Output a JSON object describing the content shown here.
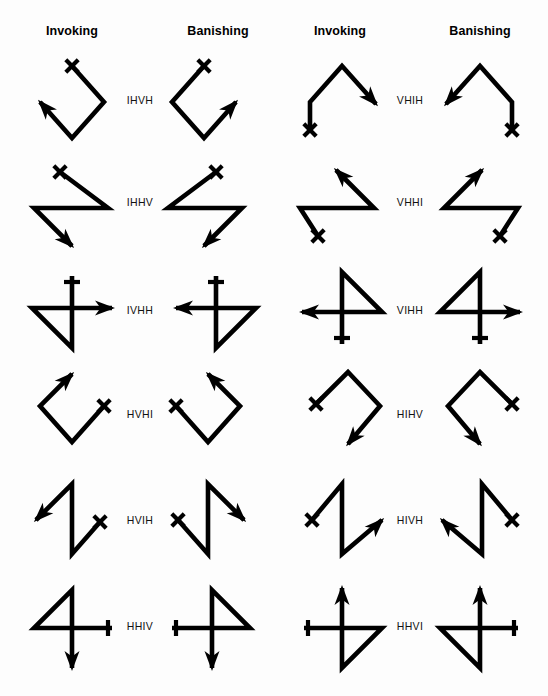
{
  "page": {
    "background": "#ffffff",
    "ink": "#000000",
    "width": 548,
    "height": 696
  },
  "headers": [
    {
      "label": "Invoking",
      "x": 72
    },
    {
      "label": "Banishing",
      "x": 218
    },
    {
      "label": "Invoking",
      "x": 340
    },
    {
      "label": "Banishing",
      "x": 480
    }
  ],
  "rows": [
    {
      "label": "IHVH",
      "label_x": 140,
      "label_y": 100,
      "side": "left"
    },
    {
      "label": "IHHV",
      "label_x": 140,
      "label_y": 202,
      "side": "left"
    },
    {
      "label": "IVHH",
      "label_x": 140,
      "label_y": 310,
      "side": "left"
    },
    {
      "label": "HVHI",
      "label_x": 140,
      "label_y": 414,
      "side": "left"
    },
    {
      "label": "HVIH",
      "label_x": 140,
      "label_y": 520,
      "side": "left"
    },
    {
      "label": "HHIV",
      "label_x": 140,
      "label_y": 626,
      "side": "left"
    },
    {
      "label": "VHIH",
      "label_x": 410,
      "label_y": 100,
      "side": "right"
    },
    {
      "label": "VHHI",
      "label_x": 410,
      "label_y": 202,
      "side": "right"
    },
    {
      "label": "VIHH",
      "label_x": 410,
      "label_y": 310,
      "side": "right"
    },
    {
      "label": "HIHV",
      "label_x": 410,
      "label_y": 414,
      "side": "right"
    },
    {
      "label": "HIVH",
      "label_x": 410,
      "label_y": 520,
      "side": "right"
    },
    {
      "label": "HHVI",
      "label_x": 410,
      "label_y": 626,
      "side": "right"
    }
  ],
  "sigils": [
    {
      "name": "ihvh-invoking",
      "row": 1,
      "column": "invoking-left",
      "label": "IHVH",
      "path": "M 72,66 L 104,102 L 72,138 L 40,102",
      "start_mark": {
        "type": "x",
        "x": 72,
        "y": 66
      },
      "end_arrow": {
        "x": 40,
        "y": 102,
        "angle": 228
      }
    },
    {
      "name": "ihvh-banishing",
      "row": 1,
      "column": "banishing-left",
      "label": "IHVH",
      "path": "M 204,66 L 172,102 L 204,138 L 236,102",
      "start_mark": {
        "type": "x",
        "x": 204,
        "y": 66
      },
      "end_arrow": {
        "x": 236,
        "y": 102,
        "angle": 312
      }
    },
    {
      "name": "vhih-invoking",
      "row": 1,
      "column": "invoking-right",
      "label": "VHIH",
      "path": "M 310,130 L 310,102 L 342,66 L 376,104",
      "start_mark": {
        "type": "x",
        "x": 310,
        "y": 130
      },
      "end_arrow": {
        "x": 376,
        "y": 104,
        "angle": 48
      }
    },
    {
      "name": "vhih-banishing",
      "row": 1,
      "column": "banishing-right",
      "label": "VHIH",
      "path": "M 512,130 L 512,102 L 480,66 L 446,104",
      "start_mark": {
        "type": "x",
        "x": 512,
        "y": 130
      },
      "end_arrow": {
        "x": 446,
        "y": 104,
        "angle": 132
      }
    },
    {
      "name": "ihhv-invoking",
      "row": 2,
      "column": "invoking-left",
      "label": "IHHV",
      "path": "M 60,172 L 108,208 L 34,208 L 72,246",
      "start_mark": {
        "type": "x",
        "x": 60,
        "y": 172
      },
      "end_arrow": {
        "x": 72,
        "y": 246,
        "angle": 45
      }
    },
    {
      "name": "ihhv-banishing",
      "row": 2,
      "column": "banishing-left",
      "label": "IHHV",
      "path": "M 216,172 L 168,208 L 242,208 L 204,246",
      "start_mark": {
        "type": "x",
        "x": 216,
        "y": 172
      },
      "end_arrow": {
        "x": 204,
        "y": 246,
        "angle": 135
      }
    },
    {
      "name": "vhhi-invoking",
      "row": 2,
      "column": "invoking-right",
      "label": "VHHI",
      "path": "M 318,236 L 300,208 L 374,208 L 336,170",
      "start_mark": {
        "type": "x",
        "x": 318,
        "y": 236
      },
      "end_arrow": {
        "x": 336,
        "y": 170,
        "angle": 225
      }
    },
    {
      "name": "vhhi-banishing",
      "row": 2,
      "column": "banishing-right",
      "label": "VHHI",
      "path": "M 500,236 L 518,208 L 444,208 L 482,170",
      "start_mark": {
        "type": "x",
        "x": 500,
        "y": 236
      },
      "end_arrow": {
        "x": 482,
        "y": 170,
        "angle": 315
      }
    },
    {
      "name": "ivhh-invoking",
      "row": 3,
      "column": "invoking-left",
      "label": "IVHH",
      "path": "M 72,276 L 72,348 L 32,308 L 112,308",
      "start_mark": {
        "type": "tick-h",
        "x": 72,
        "y": 282,
        "len": 16
      },
      "end_arrow": {
        "x": 112,
        "y": 308,
        "angle": 0
      }
    },
    {
      "name": "ivhh-banishing",
      "row": 3,
      "column": "banishing-left",
      "label": "IVHH",
      "path": "M 216,276 L 216,348 L 256,308 L 176,308",
      "start_mark": {
        "type": "tick-h",
        "x": 216,
        "y": 282,
        "len": 16
      },
      "end_arrow": {
        "x": 176,
        "y": 308,
        "angle": 180
      }
    },
    {
      "name": "vihh-invoking",
      "row": 3,
      "column": "invoking-right",
      "label": "VIHH",
      "path": "M 342,344 L 342,272 L 382,312 L 302,312",
      "start_mark": {
        "type": "tick-h",
        "x": 342,
        "y": 338,
        "len": 16
      },
      "end_arrow": {
        "x": 302,
        "y": 312,
        "angle": 180
      }
    },
    {
      "name": "vihh-banishing",
      "row": 3,
      "column": "banishing-right",
      "label": "VIHH",
      "path": "M 480,344 L 480,272 L 440,312 L 520,312",
      "start_mark": {
        "type": "tick-h",
        "x": 480,
        "y": 338,
        "len": 16
      },
      "end_arrow": {
        "x": 520,
        "y": 312,
        "angle": 0
      }
    },
    {
      "name": "hvhi-invoking",
      "row": 4,
      "column": "invoking-left",
      "label": "HVHI",
      "path": "M 104,406 L 72,442 L 40,406 L 72,374",
      "start_mark": {
        "type": "x",
        "x": 104,
        "y": 406
      },
      "end_arrow": {
        "x": 72,
        "y": 374,
        "angle": 315
      }
    },
    {
      "name": "hvhi-banishing",
      "row": 4,
      "column": "banishing-left",
      "label": "HVHI",
      "path": "M 176,406 L 208,442 L 240,406 L 208,374",
      "start_mark": {
        "type": "x",
        "x": 176,
        "y": 406
      },
      "end_arrow": {
        "x": 208,
        "y": 374,
        "angle": 225
      }
    },
    {
      "name": "hihv-invoking",
      "row": 4,
      "column": "invoking-right",
      "label": "HIHV",
      "path": "M 316,404 L 348,372 L 380,406 L 348,444",
      "start_mark": {
        "type": "x",
        "x": 316,
        "y": 404
      },
      "end_arrow": {
        "x": 348,
        "y": 444,
        "angle": 130
      }
    },
    {
      "name": "hihv-banishing",
      "row": 4,
      "column": "banishing-right",
      "label": "HIHV",
      "path": "M 512,404 L 480,372 L 448,406 L 480,444",
      "start_mark": {
        "type": "x",
        "x": 512,
        "y": 404
      },
      "end_arrow": {
        "x": 480,
        "y": 444,
        "angle": 50
      }
    },
    {
      "name": "hvih-invoking",
      "row": 5,
      "column": "invoking-left",
      "label": "HVIH",
      "path": "M 100,522 L 72,554 L 72,484 L 36,520",
      "start_mark": {
        "type": "x",
        "x": 100,
        "y": 522
      },
      "end_arrow": {
        "x": 36,
        "y": 520,
        "angle": 135
      }
    },
    {
      "name": "hvih-banishing",
      "row": 5,
      "column": "banishing-left",
      "label": "HVIH",
      "path": "M 178,520 L 208,554 L 208,484 L 244,520",
      "start_mark": {
        "type": "x",
        "x": 178,
        "y": 520
      },
      "end_arrow": {
        "x": 244,
        "y": 520,
        "angle": 45
      }
    },
    {
      "name": "hivh-invoking",
      "row": 5,
      "column": "invoking-right",
      "label": "HIVH",
      "path": "M 312,520 L 342,484 L 342,554 L 382,520",
      "start_mark": {
        "type": "x",
        "x": 312,
        "y": 520
      },
      "end_arrow": {
        "x": 382,
        "y": 520,
        "angle": 315
      }
    },
    {
      "name": "hivh-banishing",
      "row": 5,
      "column": "banishing-right",
      "label": "HIVH",
      "path": "M 512,520 L 482,484 L 482,554 L 442,520",
      "start_mark": {
        "type": "x",
        "x": 512,
        "y": 520
      },
      "end_arrow": {
        "x": 442,
        "y": 520,
        "angle": 225
      }
    },
    {
      "name": "hhiv-invoking",
      "row": 6,
      "column": "invoking-left",
      "label": "HHIV",
      "path": "M 112,628 L 34,628 L 72,590 L 72,668",
      "start_mark": {
        "type": "tick-v",
        "x": 108,
        "y": 628,
        "len": 16
      },
      "end_arrow": {
        "x": 72,
        "y": 668,
        "angle": 90
      }
    },
    {
      "name": "hhiv-banishing",
      "row": 6,
      "column": "banishing-left",
      "label": "HHIV",
      "path": "M 172,628 L 250,628 L 212,590 L 212,668",
      "start_mark": {
        "type": "tick-v",
        "x": 176,
        "y": 628,
        "len": 16
      },
      "end_arrow": {
        "x": 212,
        "y": 668,
        "angle": 90
      }
    },
    {
      "name": "hhvi-invoking",
      "row": 6,
      "column": "invoking-right",
      "label": "HHVI",
      "path": "M 304,628 L 382,628 L 342,668 L 342,588",
      "start_mark": {
        "type": "tick-v",
        "x": 308,
        "y": 628,
        "len": 16
      },
      "end_arrow": {
        "x": 342,
        "y": 588,
        "angle": 270
      }
    },
    {
      "name": "hhvi-banishing",
      "row": 6,
      "column": "banishing-right",
      "label": "HHVI",
      "path": "M 518,628 L 440,628 L 480,668 L 480,588",
      "start_mark": {
        "type": "tick-v",
        "x": 514,
        "y": 628,
        "len": 16
      },
      "end_arrow": {
        "x": 480,
        "y": 588,
        "angle": 270
      }
    }
  ]
}
